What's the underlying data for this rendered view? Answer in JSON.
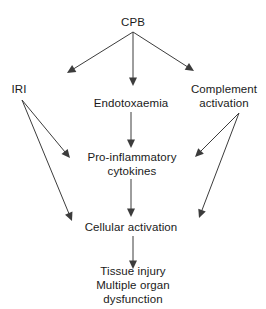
{
  "diagram": {
    "type": "flowchart",
    "background_color": "#ffffff",
    "text_color": "#1a1a1a",
    "arrow_color": "#3c3c3c",
    "nodes": [
      {
        "id": "cpb",
        "label": "CPB",
        "x": 133,
        "y": 22
      },
      {
        "id": "iri",
        "label": "IRI",
        "x": 19,
        "y": 89
      },
      {
        "id": "endo",
        "label": "Endotoxaemia",
        "x": 131,
        "y": 103
      },
      {
        "id": "complement",
        "label": "Complement\nactivation",
        "x": 224,
        "y": 96
      },
      {
        "id": "cytokines",
        "label": "Pro-inflammatory\ncytokines",
        "x": 132,
        "y": 164
      },
      {
        "id": "cellular",
        "label": "Cellular activation",
        "x": 131,
        "y": 227
      },
      {
        "id": "outcome",
        "label": "Tissue injury\nMultiple organ dysfunction",
        "x": 133,
        "y": 285
      }
    ],
    "edges": [
      {
        "id": "cpb-to-iri",
        "from": "cpb",
        "to": "iri",
        "x1": 133,
        "y1": 32,
        "x2": 67,
        "y2": 73
      },
      {
        "id": "cpb-to-endotoxaemia",
        "from": "cpb",
        "to": "endo",
        "x1": 133,
        "y1": 32,
        "x2": 133,
        "y2": 86
      },
      {
        "id": "cpb-to-complement",
        "from": "cpb",
        "to": "complement",
        "x1": 133,
        "y1": 32,
        "x2": 194,
        "y2": 71
      },
      {
        "id": "iri-to-cytokines",
        "from": "iri",
        "to": "cytokines",
        "x1": 22,
        "y1": 100,
        "x2": 70,
        "y2": 158
      },
      {
        "id": "iri-to-cellular",
        "from": "iri",
        "to": "cellular",
        "x1": 22,
        "y1": 100,
        "x2": 72,
        "y2": 221
      },
      {
        "id": "endotoxaemia-to-cytokines",
        "from": "endo",
        "to": "cytokines",
        "x1": 131,
        "y1": 112,
        "x2": 131,
        "y2": 148
      },
      {
        "id": "complement-to-cytokines",
        "from": "complement",
        "to": "cytokines",
        "x1": 239,
        "y1": 113,
        "x2": 195,
        "y2": 157
      },
      {
        "id": "complement-to-cellular",
        "from": "complement",
        "to": "cellular",
        "x1": 239,
        "y1": 113,
        "x2": 199,
        "y2": 218
      },
      {
        "id": "cytokines-to-cellular",
        "from": "cytokines",
        "to": "cellular",
        "x1": 131,
        "y1": 179,
        "x2": 131,
        "y2": 217
      },
      {
        "id": "cellular-to-outcome",
        "from": "cellular",
        "to": "outcome",
        "x1": 133,
        "y1": 236,
        "x2": 133,
        "y2": 269
      }
    ]
  }
}
